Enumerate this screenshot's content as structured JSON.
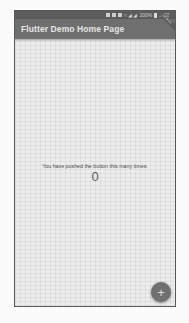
{
  "status_bar": {
    "icons": [
      "notification-icon",
      "notification-icon",
      "notification-icon",
      "notification-icon"
    ],
    "signal_text": "≈ ◢ ◢",
    "battery_percent": "100%",
    "time": "3:42"
  },
  "app_bar": {
    "title": "Flutter Demo Home Page",
    "debug_banner": "DEBUG"
  },
  "body": {
    "message": "You have pushed the button this many times:",
    "counter": "0"
  },
  "fab": {
    "icon": "add-icon",
    "glyph": "+",
    "tooltip": "Increment"
  },
  "colors": {
    "app_bar": "#6f6f6f",
    "status_bar": "#5c5c5c",
    "background": "#ececec",
    "fab": "#707070"
  }
}
